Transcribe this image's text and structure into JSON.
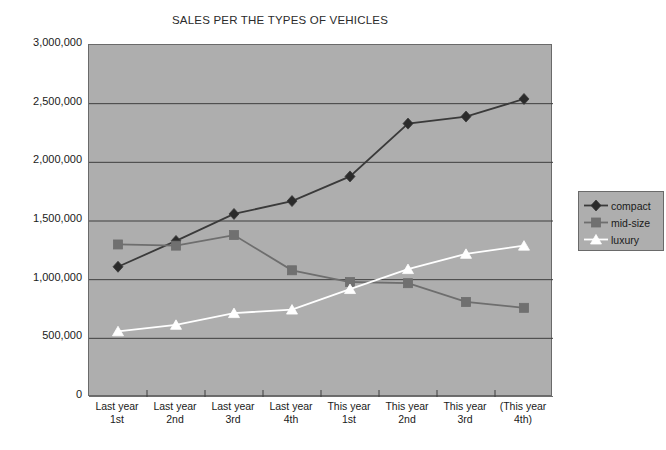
{
  "chart_data": {
    "type": "line",
    "title": "SALES PER THE TYPES OF VEHICLES",
    "xlabel": "",
    "ylabel": "",
    "ylim": [
      0,
      3000000
    ],
    "grid": true,
    "legend_position": "right",
    "categories": [
      {
        "line1": "Last year",
        "line2": "1st"
      },
      {
        "line1": "Last year",
        "line2": "2nd"
      },
      {
        "line1": "Last year",
        "line2": "3rd"
      },
      {
        "line1": "Last year",
        "line2": "4th"
      },
      {
        "line1": "This year",
        "line2": "1st"
      },
      {
        "line1": "This year",
        "line2": "2nd"
      },
      {
        "line1": "This year",
        "line2": "3rd"
      },
      {
        "line1": "(This year",
        "line2": "4th)"
      }
    ],
    "ytick_labels": [
      "3,000,000",
      "2,500,000",
      "2,000,000",
      "1,500,000",
      "1,000,000",
      "500,000",
      "0"
    ],
    "ytick_values": [
      3000000,
      2500000,
      2000000,
      1500000,
      1000000,
      500000,
      0
    ],
    "series": [
      {
        "name": "compact",
        "color": "#3a3a3a",
        "marker": "diamond",
        "marker_fill": "#2b2b2b",
        "values": [
          1110000,
          1330000,
          1560000,
          1670000,
          1880000,
          2330000,
          2390000,
          2540000
        ]
      },
      {
        "name": "mid-size",
        "color": "#6e6e6e",
        "marker": "square",
        "marker_fill": "#707070",
        "values": [
          1300000,
          1290000,
          1380000,
          1080000,
          980000,
          970000,
          810000,
          760000
        ]
      },
      {
        "name": "luxury",
        "color": "#ffffff",
        "marker": "triangle",
        "marker_fill": "#ffffff",
        "values": [
          560000,
          615000,
          715000,
          745000,
          920000,
          1090000,
          1220000,
          1290000
        ]
      }
    ]
  },
  "legend": {
    "items": [
      {
        "label": "compact"
      },
      {
        "label": "mid-size"
      },
      {
        "label": "luxury"
      }
    ]
  },
  "colors": {
    "plot_background": "#aeaeae",
    "page_background": "#ffffff",
    "axis": "#555555",
    "gridline": "#3f3f3f"
  }
}
